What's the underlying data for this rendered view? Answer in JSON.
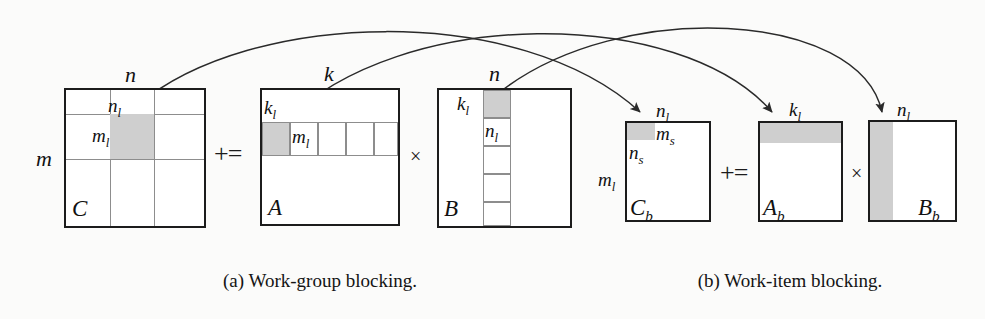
{
  "figure": {
    "panels": [
      {
        "id": "a",
        "caption": "(a) Work-group blocking.",
        "equation_ops": [
          "+=",
          "×"
        ],
        "matrices": [
          {
            "name": "C",
            "name_plain": "C",
            "outer_labels": {
              "top": "n",
              "left": "m"
            },
            "inner_labels": {
              "block_width": "n",
              "block_width_sub": "l",
              "block_height": "m",
              "block_height_sub": "l"
            },
            "grid": {
              "cols": 3,
              "rows": 3
            },
            "shaded_cell": {
              "col": 1,
              "row": 1
            }
          },
          {
            "name": "A",
            "name_plain": "A",
            "outer_labels": {
              "top": "k"
            },
            "inner_labels": {
              "strip_height": "k",
              "strip_height_sub": "l",
              "cell_width": "m",
              "cell_width_sub": "l"
            },
            "strip": {
              "orientation": "horizontal",
              "cells": 5,
              "shaded_index": 0
            }
          },
          {
            "name": "B",
            "name_plain": "B",
            "outer_labels": {
              "top": "n"
            },
            "inner_labels": {
              "strip_width": "k",
              "strip_width_sub": "l",
              "cell_height": "n",
              "cell_height_sub": "l"
            },
            "strip": {
              "orientation": "vertical",
              "cells": 5,
              "shaded_index": 0
            }
          }
        ]
      },
      {
        "id": "b",
        "caption": "(b) Work-item blocking.",
        "equation_ops": [
          "+=",
          "×"
        ],
        "matrices": [
          {
            "name": "C_b",
            "name_plain": "C",
            "name_sub": "b",
            "outer_labels": {
              "top": "n",
              "top_sub": "l",
              "left": "m",
              "left_sub": "l"
            },
            "inner_labels": {
              "shade_width": "m",
              "shade_width_sub": "s",
              "shade_height": "n",
              "shade_height_sub": "s"
            },
            "shaded": {
              "position": "top-left",
              "width_frac": 0.32,
              "height_frac": 0.16
            }
          },
          {
            "name": "A_b",
            "name_plain": "A",
            "name_sub": "b",
            "outer_labels": {
              "top": "k",
              "top_sub": "l"
            },
            "shaded": {
              "position": "top-band",
              "height_frac": 0.2
            }
          },
          {
            "name": "B_b",
            "name_plain": "B",
            "name_sub": "b",
            "outer_labels": {
              "top": "n",
              "top_sub": "l"
            },
            "shaded": {
              "position": "left-band",
              "width_frac": 0.26
            }
          }
        ]
      }
    ],
    "arrows": [
      {
        "from": "C-shaded-cell",
        "to": "C_b-shaded",
        "label_at_target": "n_l"
      },
      {
        "from": "A-shaded-cell",
        "to": "A_b-shaded",
        "label_at_target": "k_l"
      },
      {
        "from": "B-shaded-cell",
        "to": "B_b-shaded",
        "label_at_target": "n_l"
      }
    ],
    "colors": {
      "shade_fill": "#cfcfcf",
      "box_stroke": "#1c1c1c",
      "gridline": "#8d8d8d",
      "arrow_stroke": "#2a2a2a",
      "background": "#fbfbfa",
      "text": "#111111"
    }
  }
}
